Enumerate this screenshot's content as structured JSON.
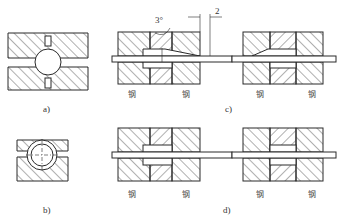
{
  "figure": {
    "panels": [
      {
        "id": "a",
        "label": "a)",
        "description": "cross-section of die with round hole and two relief slots"
      },
      {
        "id": "b",
        "label": "b)",
        "description": "cross-section of die with tube (double circle) and centerlines"
      },
      {
        "id": "c",
        "label": "c)",
        "description": "longitudinal section, tapered entry of die bore",
        "annotations": {
          "angle": "3°",
          "dimension": "2"
        },
        "material_labels": [
          "钢",
          "钢",
          "钢",
          "钢"
        ]
      },
      {
        "id": "d",
        "label": "d)",
        "description": "longitudinal section, straight die bore",
        "material_labels": [
          "钢",
          "钢",
          "钢",
          "钢"
        ]
      }
    ]
  },
  "colors": {
    "line": "#2a2a2a",
    "hatch": "#3a3a3a",
    "background": "#ffffff"
  }
}
